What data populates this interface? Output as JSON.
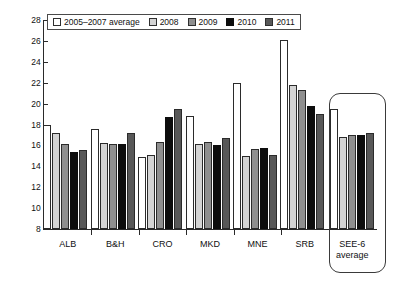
{
  "chart_data": {
    "type": "bar",
    "title": "",
    "subtitle": "",
    "xlabel": "",
    "ylabel": "",
    "ylim": [
      8,
      28
    ],
    "ytick_step": 2,
    "yticks": [
      8,
      10,
      12,
      14,
      16,
      18,
      20,
      22,
      24,
      26,
      28
    ],
    "grid": false,
    "legend_position": "top-left-inside",
    "categories": [
      "ALB",
      "B&H",
      "CRO",
      "MKD",
      "MNE",
      "SRB",
      "SEE-6 average"
    ],
    "category_labels": [
      {
        "line1": "ALB",
        "line2": ""
      },
      {
        "line1": "B&H",
        "line2": ""
      },
      {
        "line1": "CRO",
        "line2": ""
      },
      {
        "line1": "MKD",
        "line2": ""
      },
      {
        "line1": "MNE",
        "line2": ""
      },
      {
        "line1": "SRB",
        "line2": ""
      },
      {
        "line1": "SEE-6",
        "line2": "average"
      }
    ],
    "series": [
      {
        "name": "2005–2007 average",
        "color": "#ffffff",
        "values": [
          17.95,
          17.55,
          14.9,
          18.85,
          22.0,
          26.1,
          19.5
        ]
      },
      {
        "name": "2008",
        "color": "#d4d4d4",
        "values": [
          17.2,
          16.25,
          15.05,
          16.1,
          14.95,
          21.8,
          16.8
        ]
      },
      {
        "name": "2009",
        "color": "#8f8f8f",
        "values": [
          16.15,
          16.1,
          16.35,
          16.3,
          15.7,
          21.35,
          17.0
        ]
      },
      {
        "name": "2010",
        "color": "#0d0d0d",
        "values": [
          15.4,
          16.15,
          18.75,
          16.0,
          15.8,
          19.8,
          17.0
        ]
      },
      {
        "name": "2011",
        "color": "#585858",
        "values": [
          15.6,
          17.2,
          19.5,
          16.7,
          15.05,
          19.05,
          17.15
        ]
      }
    ],
    "annotations": [
      {
        "name": "see6-highlight-box",
        "shape": "rounded-rectangle",
        "target": "SEE-6 average"
      }
    ]
  }
}
